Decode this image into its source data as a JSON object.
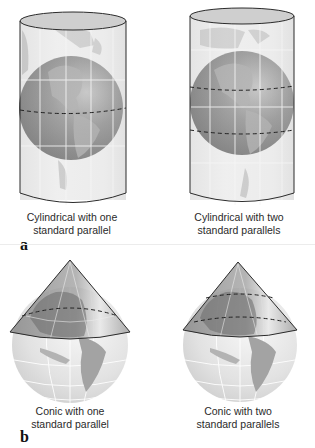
{
  "figure": {
    "panels": [
      {
        "label": "a",
        "items": [
          {
            "id": "cyl-one",
            "type": "cylindrical",
            "standard_parallels": 1,
            "caption_line1": "Cylindrical with one",
            "caption_line2": "standard parallel"
          },
          {
            "id": "cyl-two",
            "type": "cylindrical",
            "standard_parallels": 2,
            "caption_line1": "Cylindrical with two",
            "caption_line2": "standard parallels"
          }
        ]
      },
      {
        "label": "b",
        "items": [
          {
            "id": "con-one",
            "type": "conic",
            "standard_parallels": 1,
            "caption_line1": "Conic with one",
            "caption_line2": "standard parallel"
          },
          {
            "id": "con-two",
            "type": "conic",
            "standard_parallels": 2,
            "caption_line1": "Conic with two",
            "caption_line2": "standard parallels"
          }
        ]
      }
    ],
    "colors": {
      "surface_fill": "#e6e6e6",
      "globe_fill": "#7a7a7a",
      "land_fill": "#a9a9a9",
      "outline": "#2b2b2b",
      "graticule": "#f4f4f4",
      "parallel_dash": "#222222"
    }
  }
}
